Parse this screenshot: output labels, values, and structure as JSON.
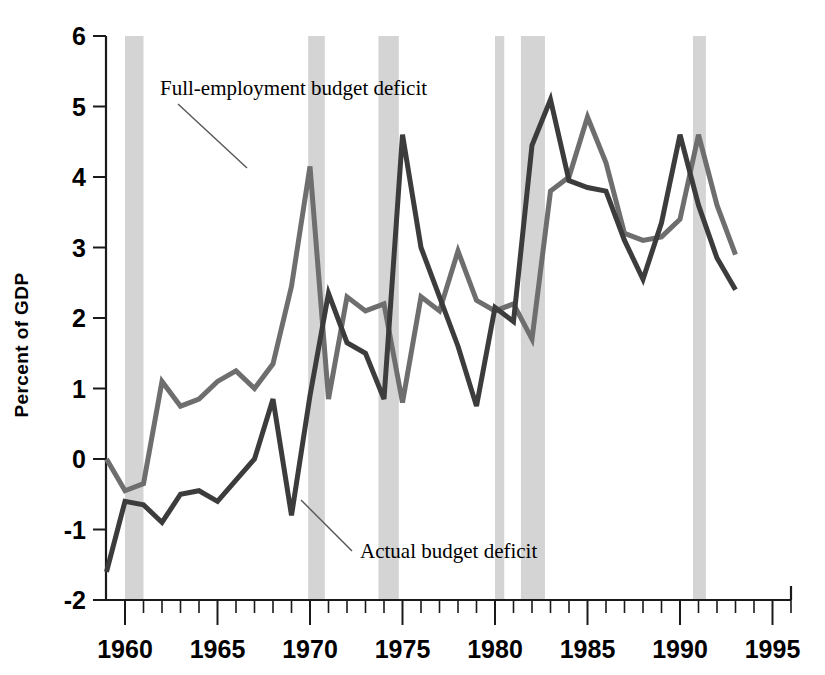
{
  "chart_data": {
    "type": "line",
    "title": "",
    "xlabel": "",
    "ylabel": "Percent of GDP",
    "xlim": [
      1959,
      1996
    ],
    "ylim": [
      -2,
      6
    ],
    "grid": false,
    "legend_position": "inline-annotations",
    "x_tick_labels": [
      "1960",
      "1965",
      "1970",
      "1975",
      "1980",
      "1985",
      "1990",
      "1995"
    ],
    "x_major_ticks": [
      1960,
      1965,
      1970,
      1975,
      1980,
      1985,
      1990,
      1995
    ],
    "x_minor_tick_step": 1,
    "y_tick_labels": [
      "-2",
      "-1",
      "0",
      "1",
      "2",
      "3",
      "4",
      "5",
      "6"
    ],
    "y_major_ticks": [
      -2,
      -1,
      0,
      1,
      2,
      3,
      4,
      5,
      6
    ],
    "x": [
      1959,
      1960,
      1961,
      1962,
      1963,
      1964,
      1965,
      1966,
      1967,
      1968,
      1969,
      1970,
      1971,
      1972,
      1973,
      1974,
      1975,
      1976,
      1977,
      1978,
      1979,
      1980,
      1981,
      1982,
      1983,
      1984,
      1985,
      1986,
      1987,
      1988,
      1989,
      1990,
      1991,
      1992,
      1993,
      1994,
      1995,
      1996
    ],
    "series": [
      {
        "name": "Full-employment budget deficit",
        "color": "#6e6e6e",
        "values": [
          0.0,
          -0.45,
          -0.35,
          1.1,
          0.75,
          0.85,
          1.1,
          1.25,
          1.0,
          1.35,
          1.8,
          2.15,
          2.45,
          4.15,
          2.4,
          0.85,
          2.3,
          2.1,
          2.2,
          2.2,
          0.8,
          1.1,
          2.1,
          2.55,
          2.2,
          2.95,
          2.25,
          2.1,
          2.2,
          1.7,
          1.8,
          3.5,
          4.0,
          4.85,
          4.2,
          3.2,
          3.1,
          3.15
        ]
      },
      {
        "name": "Actual budget deficit",
        "color": "#3c3c3c",
        "values": [
          -1.6,
          -0.95,
          -0.6,
          -0.65,
          -0.55,
          -0.8,
          -0.5,
          -0.45,
          -0.6,
          -0.3,
          -0.35,
          0.0,
          0.25,
          0.85,
          0.7,
          0.45,
          -0.8,
          0.85,
          2.3,
          1.65,
          1.5,
          0.85,
          4.6,
          3.0,
          2.3,
          1.6,
          2.1,
          2.1,
          1.95,
          1.7,
          4.45,
          5.1,
          3.95,
          3.85,
          3.8,
          3.1,
          2.55,
          2.8
        ]
      }
    ],
    "series_points": {
      "full_employment": [
        [
          1959.0,
          0.0
        ],
        [
          1960.0,
          -0.45
        ],
        [
          1961.0,
          -0.35
        ],
        [
          1962.0,
          1.1
        ],
        [
          1963.0,
          0.75
        ],
        [
          1964.0,
          0.85
        ],
        [
          1965.0,
          1.1
        ],
        [
          1966.0,
          1.25
        ],
        [
          1967.0,
          1.0
        ],
        [
          1968.0,
          1.35
        ],
        [
          1969.0,
          2.45
        ],
        [
          1970.0,
          4.15
        ],
        [
          1971.0,
          0.85
        ],
        [
          1972.0,
          2.3
        ],
        [
          1973.0,
          2.1
        ],
        [
          1974.0,
          2.2
        ],
        [
          1975.0,
          0.8
        ],
        [
          1976.0,
          2.3
        ],
        [
          1977.0,
          2.1
        ],
        [
          1978.0,
          2.95
        ],
        [
          1979.0,
          2.25
        ],
        [
          1980.0,
          2.1
        ],
        [
          1981.0,
          2.2
        ],
        [
          1982.0,
          1.7
        ],
        [
          1983.0,
          3.8
        ],
        [
          1984.0,
          4.0
        ],
        [
          1985.0,
          4.85
        ],
        [
          1986.0,
          4.2
        ],
        [
          1987.0,
          3.2
        ],
        [
          1988.0,
          3.1
        ],
        [
          1989.0,
          3.15
        ],
        [
          1990.0,
          3.4
        ],
        [
          1991.0,
          4.6
        ],
        [
          1992.0,
          3.6
        ],
        [
          1993.0,
          2.9
        ]
      ],
      "actual": [
        [
          1959.0,
          -1.6
        ],
        [
          1960.0,
          -0.6
        ],
        [
          1961.0,
          -0.65
        ],
        [
          1962.0,
          -0.9
        ],
        [
          1963.0,
          -0.5
        ],
        [
          1964.0,
          -0.45
        ],
        [
          1965.0,
          -0.6
        ],
        [
          1966.0,
          -0.3
        ],
        [
          1967.0,
          0.0
        ],
        [
          1968.0,
          0.85
        ],
        [
          1969.0,
          -0.8
        ],
        [
          1970.0,
          0.9
        ],
        [
          1971.0,
          2.35
        ],
        [
          1972.0,
          1.65
        ],
        [
          1973.0,
          1.5
        ],
        [
          1974.0,
          0.85
        ],
        [
          1975.0,
          4.6
        ],
        [
          1976.0,
          3.0
        ],
        [
          1977.0,
          2.3
        ],
        [
          1978.0,
          1.6
        ],
        [
          1979.0,
          0.75
        ],
        [
          1980.0,
          2.15
        ],
        [
          1981.0,
          1.95
        ],
        [
          1982.0,
          4.45
        ],
        [
          1983.0,
          5.1
        ],
        [
          1984.0,
          3.95
        ],
        [
          1985.0,
          3.85
        ],
        [
          1986.0,
          3.8
        ],
        [
          1987.0,
          3.1
        ],
        [
          1988.0,
          2.55
        ],
        [
          1989.0,
          3.35
        ],
        [
          1990.0,
          4.6
        ],
        [
          1991.0,
          3.6
        ],
        [
          1992.0,
          2.85
        ],
        [
          1993.0,
          2.4
        ]
      ]
    },
    "recession_bands": [
      {
        "start": 1960.0,
        "end": 1961.0
      },
      {
        "start": 1969.9,
        "end": 1970.8
      },
      {
        "start": 1973.7,
        "end": 1974.8
      },
      {
        "start": 1980.0,
        "end": 1980.5
      },
      {
        "start": 1981.4,
        "end": 1982.7
      },
      {
        "start": 1990.7,
        "end": 1991.4
      }
    ],
    "annotations": [
      {
        "text": "Full-employment budget deficit",
        "label_x": 160,
        "label_y": 95,
        "leader_from": [
          178,
          104
        ],
        "leader_to": [
          247,
          168
        ]
      },
      {
        "text": "Actual budget deficit",
        "label_x": 360,
        "label_y": 558,
        "leader_from": [
          352,
          551
        ],
        "leader_to": [
          301,
          500
        ]
      }
    ],
    "colors": {
      "full_employment_line": "#6e6e6e",
      "actual_line": "#3c3c3c",
      "recession_band": "#d4d4d4",
      "axis": "#1a1a1a",
      "background": "#ffffff"
    }
  }
}
